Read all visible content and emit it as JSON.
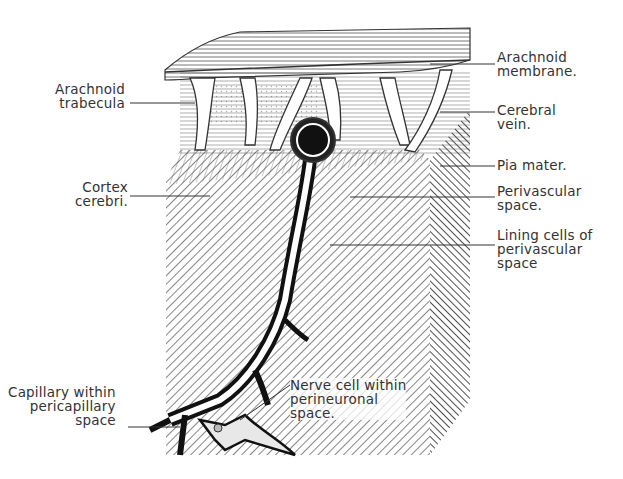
{
  "figure": {
    "labels_left": [
      {
        "id": "arachnoid-trabecula",
        "lines": [
          "Arachnoid",
          "trabecula"
        ]
      },
      {
        "id": "cortex-cerebri",
        "lines": [
          "Cortex",
          "cerebri."
        ]
      },
      {
        "id": "capillary",
        "lines": [
          "Capillary within",
          "pericapillary",
          "space"
        ]
      }
    ],
    "labels_right": [
      {
        "id": "arachnoid-membrane",
        "lines": [
          "Arachnoid",
          "membrane."
        ]
      },
      {
        "id": "cerebral-vein",
        "lines": [
          "Cerebral",
          "vein."
        ]
      },
      {
        "id": "pia-mater",
        "lines": [
          "Pia mater."
        ]
      },
      {
        "id": "perivascular-space",
        "lines": [
          "Perivascular",
          "space."
        ]
      },
      {
        "id": "lining-cells",
        "lines": [
          "Lining cells of",
          "perivascular",
          "space"
        ]
      }
    ],
    "labels_inline": [
      {
        "id": "nerve-cell",
        "lines": [
          "Nerve cell within",
          "perineuronal",
          "space."
        ]
      }
    ],
    "colors": {
      "ink": "#2a2a2a",
      "background": "#ffffff"
    }
  }
}
